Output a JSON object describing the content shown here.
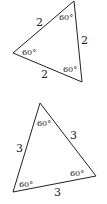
{
  "triangles": [
    {
      "id": "triangle-1",
      "vertices": [
        [
          74,
          1
        ],
        [
          13,
          53
        ],
        [
          82,
          82
        ]
      ],
      "sides": [
        "2",
        "2",
        "2"
      ],
      "angles": [
        "60°",
        "60°",
        "60°"
      ]
    },
    {
      "id": "triangle-2",
      "vertices": [
        [
          40,
          103
        ],
        [
          13,
          192
        ],
        [
          96,
          176
        ]
      ],
      "sides": [
        "3",
        "3",
        "3"
      ],
      "angles": [
        "60°",
        "60°",
        "60°"
      ]
    }
  ],
  "colors": {
    "stroke": "#222222",
    "background": "#ffffff"
  }
}
